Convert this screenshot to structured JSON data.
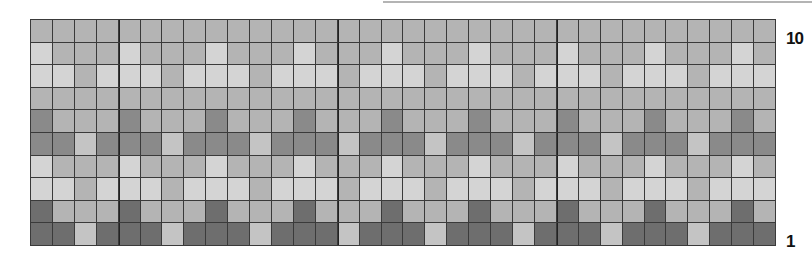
{
  "chart_data": {
    "type": "heatmap",
    "title": "",
    "columns": 34,
    "rows": 10,
    "row_labels": {
      "top": "10",
      "bottom": "1"
    },
    "block_dividers_after_columns": [
      4,
      14,
      24
    ],
    "palette": {
      "L": "#d4d4d4",
      "L2": "#c4c4c4",
      "M": "#b4b4b4",
      "D": "#8a8a8a",
      "X": "#6e6e6e"
    },
    "repeat_width": 4,
    "repeat_rows_top_to_bottom": [
      [
        "M",
        "M",
        "M",
        "M"
      ],
      [
        "L",
        "M",
        "M",
        "M"
      ],
      [
        "L",
        "L",
        "M",
        "L"
      ],
      [
        "M",
        "M",
        "M",
        "M"
      ],
      [
        "D",
        "M",
        "M",
        "M"
      ],
      [
        "D",
        "D",
        "L2",
        "D"
      ],
      [
        "L",
        "M",
        "M",
        "M"
      ],
      [
        "L",
        "L",
        "M",
        "L"
      ],
      [
        "X",
        "M",
        "M",
        "M"
      ],
      [
        "X",
        "X",
        "L2",
        "X"
      ]
    ]
  },
  "labels": {
    "row_top": "10",
    "row_bottom": "1"
  }
}
